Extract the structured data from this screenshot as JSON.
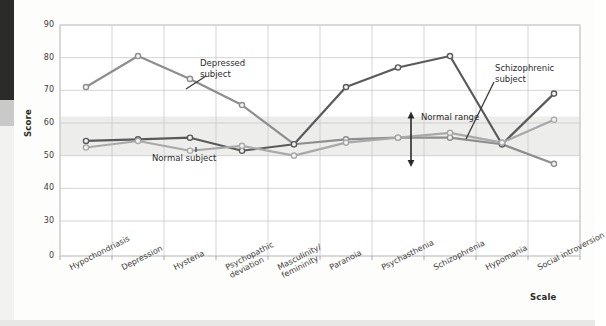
{
  "figure": {
    "background": "#fdfdfc",
    "plot_background": "#ffffff",
    "grid_color": "#c9c9cc",
    "band_color": "#ededeb"
  },
  "axes": {
    "ylabel": "Score",
    "xlabel": "Scale",
    "yticks": [
      "90",
      "80",
      "70",
      "60",
      "50",
      "40",
      "30",
      "0"
    ],
    "ymin": 0,
    "ymax": 90
  },
  "annotations": {
    "depressed": {
      "line1": "Depressed",
      "line2": "subject"
    },
    "schizophrenic": {
      "line1": "Schizophrenic",
      "line2": "subject"
    },
    "normal_subject": "Normal subject",
    "normal_range": "Normal range"
  },
  "series_colors": {
    "depressed": "#8e8e8e",
    "schizophrenic": "#5a5a5a",
    "normal": "#a9a9a9"
  },
  "chart_data": {
    "type": "line",
    "title": "",
    "xlabel": "Scale",
    "ylabel": "Score",
    "ylim": [
      0,
      90
    ],
    "yticks": [
      0,
      30,
      40,
      50,
      60,
      70,
      80,
      90
    ],
    "grid": true,
    "legend": "in-plot annotations",
    "axis_break": "between 0 and 30",
    "normal_range_band": [
      50,
      62
    ],
    "categories": [
      "Hypochondriasis",
      "Depression",
      "Hysteria",
      "Psychopathic deviation",
      "Masculinity/femininity",
      "Paranoia",
      "Psychasthenia",
      "Schizophrenia",
      "Hypomania",
      "Social introversion"
    ],
    "series": [
      {
        "name": "Depressed subject",
        "color": "#8e8e8e",
        "values": [
          71,
          80.5,
          73.5,
          65.5,
          53.5,
          55,
          55.5,
          55.5,
          53.5,
          47.5
        ]
      },
      {
        "name": "Schizophrenic subject",
        "color": "#5a5a5a",
        "values": [
          54.5,
          55,
          55.5,
          51.5,
          53.5,
          71,
          77,
          80.5,
          53.5,
          69
        ]
      },
      {
        "name": "Normal subject",
        "color": "#a9a9a9",
        "values": [
          52.5,
          54.5,
          51.5,
          53,
          50,
          54,
          55.5,
          57,
          54,
          61
        ]
      }
    ]
  }
}
